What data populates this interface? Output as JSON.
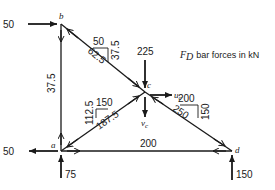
{
  "title": {
    "symbol": "F",
    "subscript": "D",
    "text": "bar forces in kN"
  },
  "nodes": {
    "a": "a",
    "b": "b",
    "c": "c",
    "d": "d"
  },
  "loads": {
    "b_horizontal": "50",
    "a_horizontal": "50",
    "a_vertical": "75",
    "c_vertical": "225",
    "d_vertical": "150"
  },
  "displacements": {
    "u": "u",
    "u_sub": "c",
    "v": "v",
    "v_sub": "c"
  },
  "bars": {
    "ab": "37.5",
    "ad": "200",
    "bc": "62.5",
    "bc_dx": "50",
    "bc_dy": "37.5",
    "ac": "187.5",
    "ac_dx": "150",
    "ac_dy": "112.5",
    "cd": "250",
    "cd_dx": "200",
    "cd_dy": "150"
  },
  "colors": {
    "ink": "#1a1a1a",
    "background": "#ffffff"
  }
}
